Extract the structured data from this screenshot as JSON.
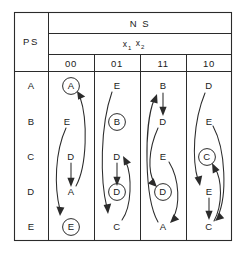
{
  "table": {
    "ps_header": "PS",
    "ns_header": "N S",
    "input_label_base": "x",
    "input_sub_1": "1",
    "input_sub_2": "2",
    "columns": [
      "00",
      "01",
      "11",
      "10"
    ],
    "rows": [
      "A",
      "B",
      "C",
      "D",
      "E"
    ],
    "cells": [
      {
        "col": "00",
        "entries": [
          {
            "row": "A",
            "value": "A",
            "circled": true
          },
          {
            "row": "B",
            "value": "E",
            "circled": false
          },
          {
            "row": "C",
            "value": "D",
            "circled": false
          },
          {
            "row": "D",
            "value": "A",
            "circled": false
          },
          {
            "row": "E",
            "value": "E",
            "circled": true
          }
        ]
      },
      {
        "col": "01",
        "entries": [
          {
            "row": "A",
            "value": "E",
            "circled": false
          },
          {
            "row": "B",
            "value": "B",
            "circled": true
          },
          {
            "row": "C",
            "value": "D",
            "circled": false
          },
          {
            "row": "D",
            "value": "D",
            "circled": true
          },
          {
            "row": "E",
            "value": "C",
            "circled": false
          }
        ]
      },
      {
        "col": "11",
        "entries": [
          {
            "row": "A",
            "value": "B",
            "circled": false
          },
          {
            "row": "B",
            "value": "D",
            "circled": false
          },
          {
            "row": "C",
            "value": "E",
            "circled": false
          },
          {
            "row": "D",
            "value": "D",
            "circled": true
          },
          {
            "row": "E",
            "value": "A",
            "circled": false
          }
        ]
      },
      {
        "col": "10",
        "entries": [
          {
            "row": "A",
            "value": "D",
            "circled": false
          },
          {
            "row": "B",
            "value": "E",
            "circled": false
          },
          {
            "row": "C",
            "value": "C",
            "circled": true
          },
          {
            "row": "D",
            "value": "E",
            "circled": false
          },
          {
            "row": "E",
            "value": "C",
            "circled": false
          }
        ]
      }
    ],
    "transitions": [
      {
        "col": "00",
        "from_row": "B",
        "from_value": "E",
        "to_row": "E",
        "to_value": "E"
      },
      {
        "col": "00",
        "from_row": "C",
        "from_value": "D",
        "to_row": "D",
        "to_value": "A"
      },
      {
        "col": "00",
        "from_row": "D",
        "from_value": "A",
        "to_row": "A",
        "to_value": "A"
      },
      {
        "col": "01",
        "from_row": "A",
        "from_value": "E",
        "to_row": "E",
        "to_value": "C"
      },
      {
        "col": "01",
        "from_row": "C",
        "from_value": "D",
        "to_row": "D",
        "to_value": "D"
      },
      {
        "col": "01",
        "from_row": "E",
        "from_value": "C",
        "to_row": "C",
        "to_value": "D"
      },
      {
        "col": "11",
        "from_row": "A",
        "from_value": "B",
        "to_row": "B",
        "to_value": "D"
      },
      {
        "col": "11",
        "from_row": "B",
        "from_value": "D",
        "to_row": "D",
        "to_value": "D"
      },
      {
        "col": "11",
        "from_row": "C",
        "from_value": "E",
        "to_row": "E",
        "to_value": "A"
      },
      {
        "col": "11",
        "from_row": "E",
        "from_value": "A",
        "to_row": "A",
        "to_value": "B"
      },
      {
        "col": "10",
        "from_row": "A",
        "from_value": "D",
        "to_row": "D",
        "to_value": "E"
      },
      {
        "col": "10",
        "from_row": "B",
        "from_value": "E",
        "to_row": "E",
        "to_value": "C"
      },
      {
        "col": "10",
        "from_row": "D",
        "from_value": "E",
        "to_row": "E",
        "to_value": "C"
      },
      {
        "col": "10",
        "from_row": "E",
        "from_value": "C",
        "to_row": "C",
        "to_value": "C"
      }
    ],
    "colors": {
      "ink": "#2b2b2b",
      "background": "#ffffff"
    }
  }
}
